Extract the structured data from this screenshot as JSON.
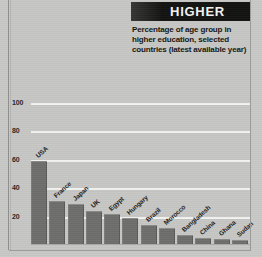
{
  "header": {
    "banner_title": "HIGHER",
    "caption": "Percentage of age group in higher education, selected countries (latest available year)"
  },
  "colors": {
    "banner_background": "#111110",
    "banner_text": "#f4f4f2",
    "bar_fill": "#6d6d6b",
    "plot_background": "#c6c6c4",
    "gridline": "#f2f2f0",
    "axis_text": "#242424"
  },
  "chart_data": {
    "type": "bar",
    "title": "HIGHER",
    "subtitle": "Percentage of age group in higher education, selected countries (latest available year)",
    "xlabel": "",
    "ylabel": "",
    "ylim": [
      0,
      110
    ],
    "yticks": [
      100,
      80,
      60,
      40,
      20
    ],
    "grid": true,
    "legend": "none",
    "categories": [
      "USA",
      "France",
      "Japan",
      "UK",
      "Egypt",
      "Hungary",
      "Brazil",
      "Morocco",
      "Bangladesh",
      "China",
      "Ghana",
      "Sudan"
    ],
    "values": [
      58,
      30,
      28,
      23,
      21,
      18,
      13,
      11,
      6,
      4,
      3.5,
      3
    ]
  }
}
